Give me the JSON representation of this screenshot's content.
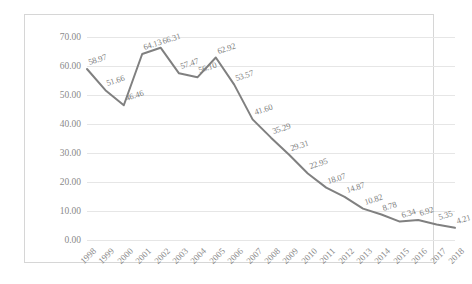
{
  "chart_data": {
    "type": "line",
    "title": "",
    "subtitle": "",
    "xlabel": "",
    "ylabel": "",
    "legend": [],
    "legend_position": "none",
    "grid": true,
    "xlim": [
      "1998",
      "2018"
    ],
    "ylim": [
      0,
      70
    ],
    "ytick_labels": [
      "70.00",
      "60.00",
      "50.00",
      "40.00",
      "30.00",
      "20.00",
      "10.00",
      "0.00"
    ],
    "ytick_values": [
      70,
      60,
      50,
      40,
      30,
      20,
      10,
      0
    ],
    "categories": [
      "1998",
      "1999",
      "2000",
      "2001",
      "2002",
      "2003",
      "2004",
      "2005",
      "2006",
      "2007",
      "2008",
      "2009",
      "2010",
      "2011",
      "2012",
      "2013",
      "2014",
      "2015",
      "2016",
      "2017",
      "2018"
    ],
    "values": [
      58.97,
      51.66,
      46.46,
      64.13,
      66.31,
      57.47,
      56.1,
      62.92,
      53.57,
      41.6,
      35.29,
      29.31,
      22.95,
      18.07,
      14.87,
      10.82,
      8.78,
      6.34,
      6.92,
      5.35,
      4.21
    ],
    "data_labels": [
      "58.97",
      "51.66",
      "46.46",
      "64.13",
      "66.31",
      "57.47",
      "56.10",
      "62.92",
      "53.57",
      "41.60",
      "35.29",
      "29.31",
      "22.95",
      "18.07",
      "14.87",
      "10.82",
      "8.78",
      "6.34",
      "6.92",
      "5.35",
      "4.21"
    ],
    "series": [
      {
        "name": "",
        "color": "#808080",
        "values": [
          58.97,
          51.66,
          46.46,
          64.13,
          66.31,
          57.47,
          56.1,
          62.92,
          53.57,
          41.6,
          35.29,
          29.31,
          22.95,
          18.07,
          14.87,
          10.82,
          8.78,
          6.34,
          6.92,
          5.35,
          4.21
        ]
      }
    ]
  },
  "style": {
    "line_color": "#808080",
    "grid_color": "#e6e6e6",
    "border_color": "#d6d6d6",
    "tick_text_color": "#8a8a8a",
    "label_text_color": "#7d7d7d",
    "background": "#ffffff"
  }
}
